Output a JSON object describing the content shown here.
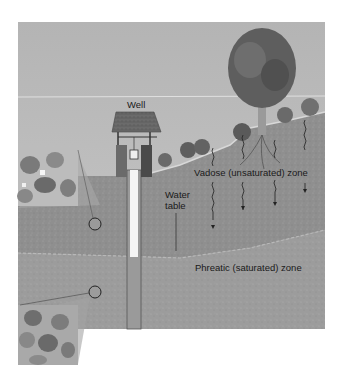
{
  "diagram": {
    "labels": {
      "well": "Well",
      "water_table_line1": "Water",
      "water_table_line2": "table",
      "vadose_zone": "Vadose (unsaturated) zone",
      "phreatic_zone": "Phreatic (saturated) zone"
    },
    "insets": [
      {
        "name": "unsaturated-pore-inset",
        "depicts": "soil grains with air-filled pores"
      },
      {
        "name": "saturated-pore-inset",
        "depicts": "soil grains with water-filled pores"
      }
    ],
    "infiltration_arrows": 4,
    "colors": {
      "sky": "#bdbdbd",
      "vadose_soil": "#8e8e8e",
      "phreatic_soil": "#9a9a9a",
      "label_text": "#1a1a1a",
      "shaft": "#f4f4f4"
    }
  }
}
